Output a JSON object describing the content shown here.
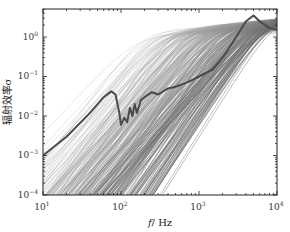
{
  "chart_data": {
    "type": "line",
    "title": "",
    "xlabel": "f / Hz",
    "ylabel": "辐射效率σ",
    "xscale": "log",
    "yscale": "log",
    "xlim": [
      10,
      10000
    ],
    "ylim": [
      0.0001,
      5
    ],
    "x_ticks": [
      "10^1",
      "10^2",
      "10^3",
      "10^4"
    ],
    "y_ticks": [
      "10^-4",
      "10^-3",
      "10^-2",
      "10^-1",
      "10^0"
    ],
    "grid": false,
    "legend": null,
    "series": [
      {
        "name": "total radiation efficiency (thick curve)",
        "style": "thick dark gray",
        "x": [
          10,
          20,
          40,
          60,
          75,
          85,
          95,
          100,
          110,
          120,
          130,
          140,
          150,
          160,
          180,
          200,
          250,
          300,
          400,
          500,
          700,
          1000,
          1500,
          2000,
          3000,
          4000,
          5000,
          6000,
          8000,
          10000
        ],
        "values": [
          0.001,
          0.003,
          0.012,
          0.03,
          0.042,
          0.035,
          0.012,
          0.006,
          0.009,
          0.007,
          0.016,
          0.01,
          0.02,
          0.012,
          0.025,
          0.03,
          0.04,
          0.035,
          0.05,
          0.055,
          0.07,
          0.1,
          0.15,
          0.3,
          1.0,
          2.5,
          3.5,
          2.5,
          1.7,
          1.5
        ]
      },
      {
        "name": "modal radiation efficiencies (thin curves)",
        "style": "thin light gray, many curves",
        "description": "Family of several hundred modal curves rising with slope ~2 in log-log from lower-left, each saturating near σ≈1–3 at its coincidence frequency between ~150 Hz and 10 kHz"
      }
    ]
  },
  "labels": {
    "xlabel_f": "f",
    "xlabel_unit": "/ Hz",
    "ylabel": "辐射效率σ",
    "xticks": [
      {
        "base": "10",
        "exp": "1"
      },
      {
        "base": "10",
        "exp": "2"
      },
      {
        "base": "10",
        "exp": "3"
      },
      {
        "base": "10",
        "exp": "4"
      }
    ],
    "yticks": [
      {
        "base": "10",
        "exp": "0"
      },
      {
        "base": "10",
        "exp": "−1"
      },
      {
        "base": "10",
        "exp": "−2"
      },
      {
        "base": "10",
        "exp": "−3"
      },
      {
        "base": "10",
        "exp": "−4"
      }
    ]
  }
}
